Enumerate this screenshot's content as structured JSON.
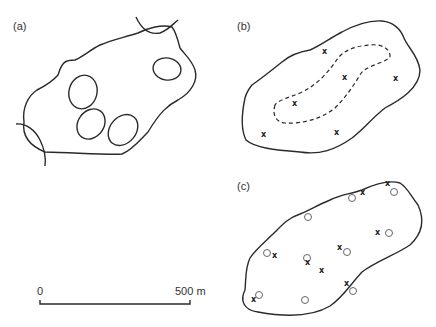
{
  "panels": {
    "a": {
      "label": "(a)"
    },
    "b": {
      "label": "(b)"
    },
    "c": {
      "label": "(c)"
    }
  },
  "scale_bar": {
    "start_label": "0",
    "end_label": "500 m"
  },
  "markers": {
    "x_symbol": "x",
    "b_points": [
      [
        325,
        53
      ],
      [
        345,
        79
      ],
      [
        396,
        80
      ],
      [
        295,
        105
      ],
      [
        264,
        136
      ],
      [
        337,
        134
      ]
    ],
    "c_x_points": [
      [
        363,
        194
      ],
      [
        388,
        185
      ],
      [
        378,
        234
      ],
      [
        340,
        249
      ],
      [
        275,
        257
      ],
      [
        308,
        264
      ],
      [
        322,
        272
      ],
      [
        347,
        285
      ],
      [
        254,
        301
      ]
    ],
    "c_o_points": [
      [
        352,
        198
      ],
      [
        394,
        192
      ],
      [
        308,
        217
      ],
      [
        389,
        232
      ],
      [
        267,
        253
      ],
      [
        306,
        258
      ],
      [
        347,
        252
      ],
      [
        353,
        290
      ],
      [
        259,
        295
      ],
      [
        305,
        300
      ]
    ]
  }
}
